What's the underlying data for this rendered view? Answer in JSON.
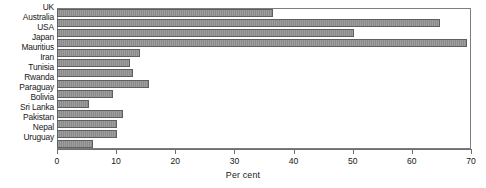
{
  "chart_data": {
    "type": "bar",
    "orientation": "horizontal",
    "title": "",
    "subtitle": "",
    "xlabel": "Per cent",
    "ylabel": "",
    "xlim": [
      0,
      70
    ],
    "ylim": null,
    "xticks": [
      0,
      10,
      20,
      30,
      40,
      50,
      60,
      70
    ],
    "xticklabels": [
      "0",
      "10",
      "20",
      "30",
      "40",
      "50",
      "60",
      "70"
    ],
    "grid": false,
    "legend": null,
    "legend_position": "none",
    "annotations": [],
    "bar_color": "#8b8b8b",
    "bar_edge_color": "#5f5f5f",
    "frame_color": "#7d7d7d",
    "categories": [
      "UK",
      "Australia",
      "USA",
      "Japan",
      "Mauritius",
      "Iran",
      "Tunisia",
      "Rwanda",
      "Paraguay",
      "Bolivia",
      "Sri Lanka",
      "Pakistan",
      "Nepal",
      "Uruguay"
    ],
    "values": [
      36.5,
      64.8,
      50.2,
      69.3,
      14.0,
      12.4,
      12.8,
      15.6,
      9.4,
      5.4,
      11.2,
      10.1,
      10.1,
      6.1
    ]
  }
}
